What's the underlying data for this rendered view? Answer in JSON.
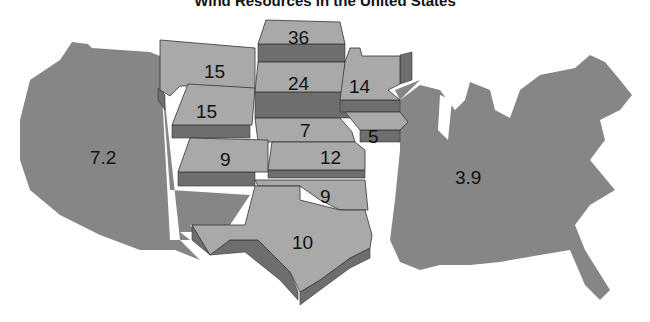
{
  "title": "Wind Resources in the United States",
  "colors": {
    "base_map": "#868686",
    "raised_top": "#a9a9a9",
    "raised_side": "#6e6e6e",
    "text": "#111111"
  },
  "regions": {
    "west": {
      "label": "7.2"
    },
    "east": {
      "label": "3.9"
    },
    "montana": {
      "label": "15"
    },
    "wyoming": {
      "label": "15"
    },
    "colorado": {
      "label": "9"
    },
    "north_dakota": {
      "label": "36"
    },
    "south_dakota": {
      "label": "24"
    },
    "nebraska": {
      "label": "7"
    },
    "kansas": {
      "label": "12"
    },
    "oklahoma": {
      "label": "9"
    },
    "texas": {
      "label": "10"
    },
    "minnesota": {
      "label": "14"
    },
    "iowa": {
      "label": "5"
    }
  }
}
